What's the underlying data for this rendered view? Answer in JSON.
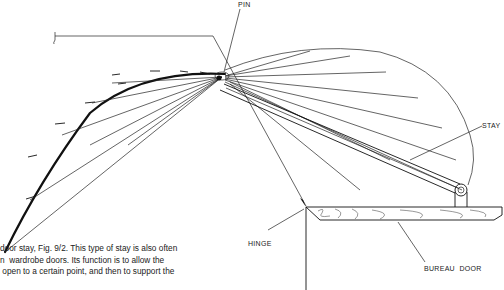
{
  "diagram": {
    "labels": {
      "pin": "PIN",
      "stay": "STAY",
      "hinge": "HINGE",
      "bureau_door": "BUREAU  DOOR"
    }
  },
  "caption": {
    "lines": [
      "door stay, Fig. 9/2. This type of stay is also often",
      "n  wardrobe doors. Its function is to allow the",
      " open to a certain point, and then to support the"
    ]
  }
}
